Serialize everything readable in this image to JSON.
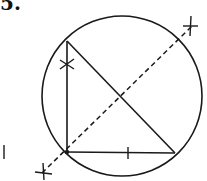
{
  "problem": {
    "number": "5."
  },
  "diagram": {
    "stroke_color": "#1a1a1a",
    "circle": {
      "cx": 122,
      "cy": 96,
      "r": 80
    },
    "triangle": {
      "vertices": [
        [
          67,
          41
        ],
        [
          67,
          152
        ],
        [
          175,
          153
        ]
      ],
      "right_angle_at": [
        67,
        152
      ]
    },
    "dashed_line": {
      "from": [
        42,
        173
      ],
      "to": [
        192,
        26
      ]
    },
    "tick_marks": [
      {
        "type": "cross",
        "at": [
          67,
          64
        ]
      },
      {
        "type": "bar",
        "at": [
          128,
          153
        ]
      },
      {
        "type": "cross",
        "at": [
          43,
          172
        ]
      },
      {
        "type": "cross",
        "at": [
          191,
          27
        ]
      }
    ],
    "margin_mark": {
      "at": [
        4,
        152
      ]
    }
  }
}
